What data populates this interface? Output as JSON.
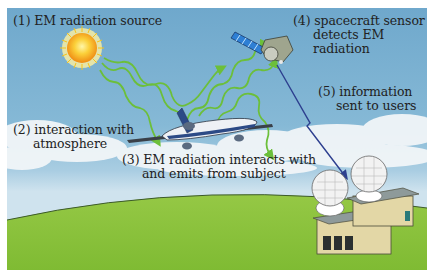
{
  "diagram": {
    "steps": [
      {
        "id": 1,
        "lines": [
          "(1) EM radiation source"
        ]
      },
      {
        "id": 2,
        "lines": [
          "(2) interaction with",
          "atmosphere"
        ]
      },
      {
        "id": 3,
        "lines": [
          "(3) EM radiation interacts with",
          "and emits from subject"
        ]
      },
      {
        "id": 4,
        "lines": [
          "(4) spacecraft sensor",
          "detects EM",
          "radiation"
        ]
      },
      {
        "id": 5,
        "lines": [
          "(5) information",
          "sent to users"
        ]
      }
    ],
    "elements": {
      "source": "sun-icon",
      "subject": "airplane-icon",
      "sensor": "satellite-icon",
      "receiver": "ground-station-icon"
    },
    "colors": {
      "sky_top": "#6fa8cc",
      "sky_bottom": "#cfe3ee",
      "ground": "#8cc43c",
      "radiation_arrows": "#6cbf3a",
      "downlink_arrow": "#2d3f8f",
      "sun_core": "#f7a21b",
      "text": "#222222"
    }
  }
}
